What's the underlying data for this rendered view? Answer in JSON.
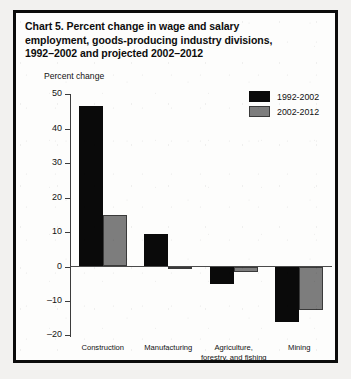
{
  "chart_data": {
    "type": "bar",
    "title": "Chart 5.  Percent change in wage and salary employment, goods-producing industry divisions, 1992–2002 and projected 2002–2012",
    "title_lines": [
      "Chart 5.  Percent change in wage and salary",
      "employment, goods-producing industry divisions,",
      "1992–2002 and projected 2002–2012"
    ],
    "xlabel": "",
    "ylabel": "Percent change",
    "ylim": [
      -20,
      50
    ],
    "ytick_step": 10,
    "yticks": [
      50,
      40,
      30,
      20,
      10,
      0,
      -10,
      -20
    ],
    "ytick_labels": [
      "50",
      "40",
      "30",
      "20",
      "10",
      "0",
      "–10",
      "–20"
    ],
    "grid": false,
    "legend_position": "top-right",
    "categories": [
      "Construction",
      "Manufacturing",
      "Agriculture, forestry, and fishing",
      "Mining"
    ],
    "category_label_lines": [
      [
        "Construction"
      ],
      [
        "Manufacturing"
      ],
      [
        "Agriculture,",
        "forestry, and fishing"
      ],
      [
        "Mining"
      ]
    ],
    "series": [
      {
        "name": "1992-2002",
        "color": "#0a0a0a",
        "values": [
          46.5,
          9.5,
          -5.0,
          -16.0
        ]
      },
      {
        "name": "2002-2012",
        "color": "#7d7d7d",
        "values": [
          15.0,
          -0.7,
          -1.6,
          -12.5
        ]
      }
    ]
  },
  "legend": {
    "items": [
      {
        "label": "1992-2002",
        "swatch": "dark"
      },
      {
        "label": "2002-2012",
        "swatch": "light"
      }
    ]
  }
}
